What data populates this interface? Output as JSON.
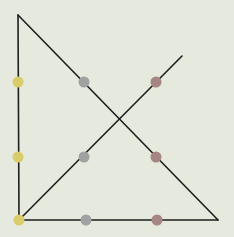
{
  "diagram": {
    "background": "#e6e9dd",
    "line_color": "#1e1e1e",
    "line_width": 1.6,
    "lines": [
      {
        "name": "left-vertical-line",
        "x1": 18,
        "y1": 15,
        "x2": 19,
        "y2": 220
      },
      {
        "name": "bottom-horizontal-line",
        "x1": 19,
        "y1": 220,
        "x2": 218,
        "y2": 220
      },
      {
        "name": "hypotenuse-line",
        "x1": 18,
        "y1": 15,
        "x2": 218,
        "y2": 220
      },
      {
        "name": "diagonal-line",
        "x1": 19,
        "y1": 220,
        "x2": 182,
        "y2": 56
      }
    ],
    "dots": [
      {
        "name": "yellow-dot-top",
        "cx": 18,
        "cy": 82,
        "color": "#d8cd6a"
      },
      {
        "name": "yellow-dot-middle",
        "cx": 18,
        "cy": 157,
        "color": "#d8cd6a"
      },
      {
        "name": "yellow-dot-corner",
        "cx": 19,
        "cy": 220,
        "color": "#d8cd6a"
      },
      {
        "name": "gray-dot-top",
        "cx": 84,
        "cy": 82,
        "color": "#9ea3a1"
      },
      {
        "name": "gray-dot-middle",
        "cx": 84,
        "cy": 157,
        "color": "#9ea3a1"
      },
      {
        "name": "gray-dot-bottom",
        "cx": 86,
        "cy": 220,
        "color": "#9ea3a1"
      },
      {
        "name": "mauve-dot-top",
        "cx": 156,
        "cy": 82,
        "color": "#a68585"
      },
      {
        "name": "mauve-dot-middle",
        "cx": 156,
        "cy": 157,
        "color": "#a68585"
      },
      {
        "name": "mauve-dot-bottom",
        "cx": 157,
        "cy": 220,
        "color": "#a68585"
      }
    ],
    "dot_radius": 5.5
  }
}
